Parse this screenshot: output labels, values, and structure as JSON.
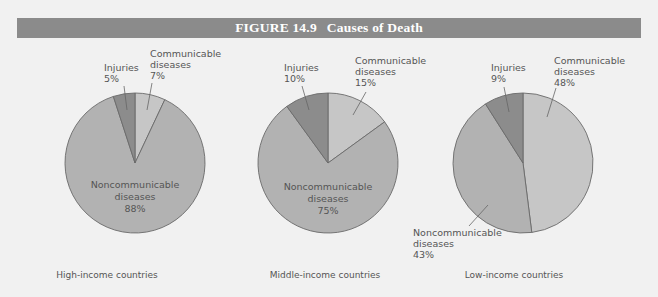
{
  "figure": {
    "label": "FIGURE 14.9",
    "title": "Causes of Death"
  },
  "colors": {
    "background": "#f1f1f1",
    "title_bar": "#8b8b8b",
    "communicable": "#c6c6c6",
    "noncommunicable": "#b2b2b2",
    "injuries": "#8c8c8c",
    "outline": "#6a6a6a"
  },
  "charts": [
    {
      "caption": "High-income countries",
      "labels": {
        "injuries": [
          "Injuries",
          "5%"
        ],
        "communicable": [
          "Communicable",
          "diseases",
          "7%"
        ],
        "noncommunicable": [
          "Noncommunicable",
          "diseases",
          "88%"
        ]
      }
    },
    {
      "caption": "Middle-income countries",
      "labels": {
        "injuries": [
          "Injuries",
          "10%"
        ],
        "communicable": [
          "Communicable",
          "diseases",
          "15%"
        ],
        "noncommunicable": [
          "Noncommunicable",
          "diseases",
          "75%"
        ]
      }
    },
    {
      "caption": "Low-income countries",
      "labels": {
        "injuries": [
          "Injuries",
          "9%"
        ],
        "communicable": [
          "Communicable",
          "diseases",
          "48%"
        ],
        "noncommunicable": [
          "Noncommunicable",
          "diseases",
          "43%"
        ]
      }
    }
  ],
  "chart_data": [
    {
      "type": "pie",
      "title": "High-income countries",
      "categories": [
        "Communicable diseases",
        "Noncommunicable diseases",
        "Injuries"
      ],
      "values": [
        7,
        88,
        5
      ],
      "unit": "%"
    },
    {
      "type": "pie",
      "title": "Middle-income countries",
      "categories": [
        "Communicable diseases",
        "Noncommunicable diseases",
        "Injuries"
      ],
      "values": [
        15,
        75,
        10
      ],
      "unit": "%"
    },
    {
      "type": "pie",
      "title": "Low-income countries",
      "categories": [
        "Communicable diseases",
        "Noncommunicable diseases",
        "Injuries"
      ],
      "values": [
        48,
        43,
        9
      ],
      "unit": "%"
    }
  ]
}
